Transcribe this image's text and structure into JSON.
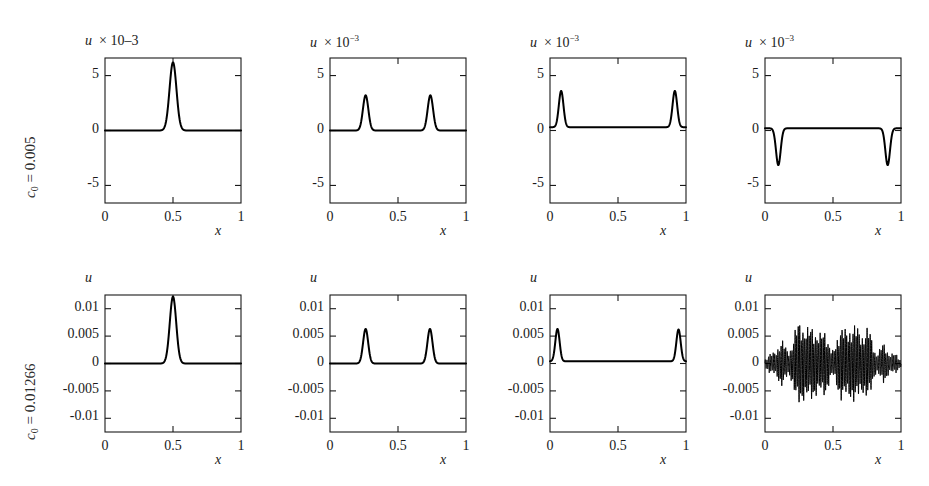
{
  "figure": {
    "rows": [
      {
        "label_prefix": "c",
        "label_sub": "0",
        "label_value": " = 0.005",
        "y_unit_exponent": "-3",
        "yticks": [
          5,
          0,
          -5
        ],
        "ytick_labels": [
          "5",
          "0",
          "-5"
        ],
        "ylim": [
          -6.6,
          6.6
        ]
      },
      {
        "label_prefix": "c",
        "label_sub": "0",
        "label_value": " = 0.01266",
        "y_unit_exponent": "",
        "yticks": [
          0.01,
          0.005,
          0,
          -0.005,
          -0.01
        ],
        "ytick_labels": [
          "0.01",
          "0.005",
          "0",
          "-0.005",
          "-0.01"
        ],
        "ylim": [
          -0.0125,
          0.0125
        ]
      }
    ],
    "xticks": [
      0,
      0.5,
      1
    ],
    "xtick_labels": [
      "0",
      "0.5",
      "1"
    ],
    "xlim": [
      0,
      1
    ],
    "x_axis_name": "x",
    "y_axis_name": "u",
    "multiply_symbol": "×",
    "base_ten": "10"
  },
  "chart_data": {
    "type": "line",
    "title": "",
    "xlabel": "x",
    "ylabel": "u",
    "grid": false,
    "legend": "none",
    "panels": [
      {
        "id": "r1c1",
        "row": 0,
        "col": 0,
        "title": "u × 10–3",
        "title_style": "inline-minus",
        "xlim": [
          0,
          1
        ],
        "ylim": [
          -6.6,
          6.6
        ],
        "y_scale": 0.001,
        "description": "single narrow positive pulse centred at x=0.5",
        "pulses": [
          {
            "center": 0.5,
            "amplitude": 6.2,
            "width": 0.045,
            "sign": 1
          }
        ],
        "baseline": 0.0,
        "oscillatory": false
      },
      {
        "id": "r1c2",
        "row": 0,
        "col": 1,
        "title": "u × 10⁻³",
        "title_style": "superscript",
        "xlim": [
          0,
          1
        ],
        "ylim": [
          -6.6,
          6.6
        ],
        "y_scale": 0.001,
        "description": "two positive pulses, split and travelling outward",
        "pulses": [
          {
            "center": 0.262,
            "amplitude": 3.2,
            "width": 0.035,
            "sign": 1
          },
          {
            "center": 0.738,
            "amplitude": 3.2,
            "width": 0.035,
            "sign": 1
          }
        ],
        "baseline": 0.0,
        "oscillatory": false
      },
      {
        "id": "r1c3",
        "row": 0,
        "col": 2,
        "title": "u × 10⁻³",
        "title_style": "superscript",
        "xlim": [
          0,
          1
        ],
        "ylim": [
          -6.6,
          6.6
        ],
        "y_scale": 0.001,
        "description": "two positive pulses near the domain edges",
        "pulses": [
          {
            "center": 0.082,
            "amplitude": 3.3,
            "width": 0.03,
            "sign": 1
          },
          {
            "center": 0.918,
            "amplitude": 3.3,
            "width": 0.03,
            "sign": 1
          }
        ],
        "baseline": 0.15,
        "oscillatory": false
      },
      {
        "id": "r1c4",
        "row": 0,
        "col": 3,
        "title": "u × 10⁻³",
        "title_style": "superscript",
        "xlim": [
          0,
          1
        ],
        "ylim": [
          -6.6,
          6.6
        ],
        "y_scale": 0.001,
        "description": "two inverted (negative) pulses after reflection at the boundaries",
        "pulses": [
          {
            "center": 0.098,
            "amplitude": 3.35,
            "width": 0.03,
            "sign": -1
          },
          {
            "center": 0.902,
            "amplitude": 3.35,
            "width": 0.03,
            "sign": -1
          }
        ],
        "baseline": 0.1,
        "oscillatory": false
      },
      {
        "id": "r2c1",
        "row": 1,
        "col": 0,
        "title": "u",
        "title_style": "plain",
        "xlim": [
          0,
          1
        ],
        "ylim": [
          -0.0125,
          0.0125
        ],
        "y_scale": 1,
        "description": "single narrow positive pulse centred at x=0.5",
        "pulses": [
          {
            "center": 0.5,
            "amplitude": 0.0122,
            "width": 0.042,
            "sign": 1
          }
        ],
        "baseline": 0.0,
        "oscillatory": false
      },
      {
        "id": "r2c2",
        "row": 1,
        "col": 1,
        "title": "u",
        "title_style": "plain",
        "xlim": [
          0,
          1
        ],
        "ylim": [
          -0.0125,
          0.0125
        ],
        "y_scale": 1,
        "description": "two positive pulses, split and travelling outward",
        "pulses": [
          {
            "center": 0.262,
            "amplitude": 0.0063,
            "width": 0.033,
            "sign": 1
          },
          {
            "center": 0.735,
            "amplitude": 0.0063,
            "width": 0.033,
            "sign": 1
          }
        ],
        "baseline": 0.0,
        "oscillatory": false
      },
      {
        "id": "r2c3",
        "row": 1,
        "col": 2,
        "title": "u",
        "title_style": "plain",
        "xlim": [
          0,
          1
        ],
        "ylim": [
          -0.0125,
          0.0125
        ],
        "y_scale": 1,
        "description": "two positive pulses near the domain edges with small residual tail",
        "pulses": [
          {
            "center": 0.055,
            "amplitude": 0.0059,
            "width": 0.028,
            "sign": 1
          },
          {
            "center": 0.945,
            "amplitude": 0.0058,
            "width": 0.028,
            "sign": 1
          }
        ],
        "baseline": 0.0004,
        "oscillatory": false
      },
      {
        "id": "r2c4",
        "row": 1,
        "col": 3,
        "title": "u",
        "title_style": "plain",
        "xlim": [
          0,
          1
        ],
        "ylim": [
          -0.0125,
          0.0125
        ],
        "y_scale": 1,
        "description": "dispersive high-frequency oscillation filling the domain, envelope with two large central lobes and small lobes at the edges",
        "pulses": [],
        "baseline": 0.0,
        "oscillatory": true,
        "oscillation": {
          "carrier_wavelength": 0.0115,
          "envelope_peak": 0.007,
          "envelope_trough": -0.0075,
          "lobes": [
            {
              "center": 0.045,
              "amplitude": 0.0018,
              "width": 0.045
            },
            {
              "center": 0.125,
              "amplitude": 0.004,
              "width": 0.04
            },
            {
              "center": 0.245,
              "amplitude": 0.0068,
              "width": 0.055
            },
            {
              "center": 0.345,
              "amplitude": 0.0062,
              "width": 0.06
            },
            {
              "center": 0.44,
              "amplitude": 0.0052,
              "width": 0.045
            },
            {
              "center": 0.56,
              "amplitude": 0.006,
              "width": 0.05
            },
            {
              "center": 0.66,
              "amplitude": 0.0068,
              "width": 0.06
            },
            {
              "center": 0.76,
              "amplitude": 0.0058,
              "width": 0.045
            },
            {
              "center": 0.87,
              "amplitude": 0.0036,
              "width": 0.04
            },
            {
              "center": 0.955,
              "amplitude": 0.0018,
              "width": 0.04
            }
          ]
        }
      }
    ]
  }
}
